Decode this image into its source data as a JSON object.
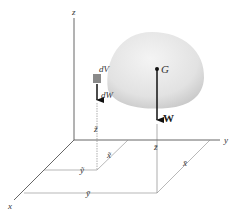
{
  "figure": {
    "type": "center-of-gravity-3d",
    "axes": {
      "x_label": "x",
      "y_label": "y",
      "z_label": "z"
    },
    "body": {
      "shape": "dome-shaped solid",
      "fill_color": "#e6e6e6"
    },
    "element": {
      "volume_label": "dV",
      "weight_label": "dW",
      "coord_x_label": "x̃",
      "coord_y_label": "ỹ",
      "coord_z_label": "z̃",
      "color": "#888888"
    },
    "centroid": {
      "point_label": "G",
      "weight_label": "W",
      "coord_x_label": "x̄",
      "coord_y_label": "ȳ",
      "coord_z_label": "z̄"
    }
  }
}
